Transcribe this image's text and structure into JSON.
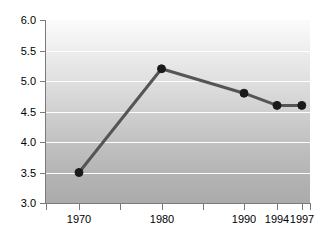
{
  "chart_data": {
    "type": "line",
    "title": "",
    "subtitle": "",
    "xlabel": "",
    "ylabel": "",
    "x": [
      1970,
      1980,
      1990,
      1994,
      1997
    ],
    "categories": [
      "1970",
      "1980",
      "1990",
      "1994",
      "1997"
    ],
    "values": [
      3.5,
      5.2,
      4.8,
      4.6,
      4.6
    ],
    "series": [
      {
        "name": "",
        "values": [
          3.5,
          5.2,
          4.8,
          4.6,
          4.6
        ]
      }
    ],
    "xlim": [
      1966,
      1998
    ],
    "ylim": [
      3.0,
      6.0
    ],
    "ytick_labels": [
      "3.0",
      "3.5",
      "4.0",
      "4.5",
      "5.0",
      "5.5",
      "6.0"
    ],
    "ytick_values": [
      3.0,
      3.5,
      4.0,
      4.5,
      5.0,
      5.5,
      6.0
    ],
    "xtick_labels": [
      "1970",
      "1980",
      "1990",
      "1994",
      "1997"
    ],
    "xtick_values": [
      1970,
      1980,
      1990,
      1994,
      1997
    ],
    "xtick_minor_values": [
      1966,
      1975,
      1985,
      1998
    ],
    "grid": "horizontal",
    "legend": "none",
    "line_color": "#555555",
    "marker_color": "#1a1a1a",
    "gridline_color": "#ffffff",
    "axis_color": "#7a7a7a",
    "plot_background_top": "#fbfbfb",
    "plot_background_bottom": "#ababab",
    "page_background": "#ffffff",
    "text_color": "#000000"
  }
}
